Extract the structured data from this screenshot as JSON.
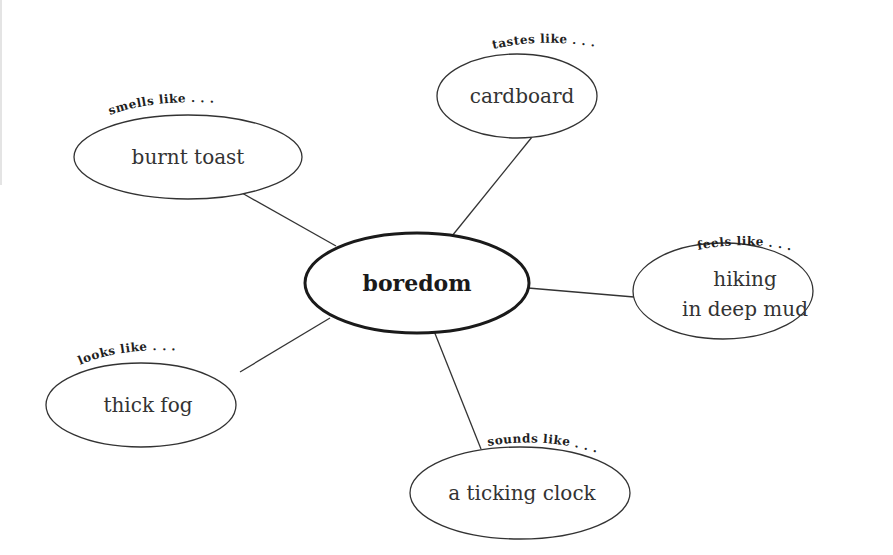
{
  "diagram": {
    "type": "concept-web",
    "center": {
      "label": "boredom"
    },
    "nodes": [
      {
        "cue": "smells like . . .",
        "label": "burnt toast"
      },
      {
        "cue": "tastes like . . .",
        "label": "cardboard"
      },
      {
        "cue": "feels like . . .",
        "label_line1": "hiking",
        "label_line2": "in deep mud"
      },
      {
        "cue": "looks like . . .",
        "label": "thick fog"
      },
      {
        "cue": "sounds like . . .",
        "label": "a ticking clock"
      }
    ],
    "colors": {
      "stroke": "#333333",
      "text": "#333333",
      "background": "#ffffff"
    }
  }
}
